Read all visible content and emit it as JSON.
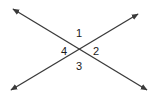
{
  "diagram": {
    "type": "intersecting-lines",
    "stroke_color": "#3a3a3a",
    "label_color": "#1a1a1a",
    "background": "#ffffff",
    "lines": [
      {
        "name": "line-a",
        "from": [
          13,
          9
        ],
        "to": [
          147,
          90
        ],
        "arrows": "both"
      },
      {
        "name": "line-b",
        "from": [
          11,
          90
        ],
        "to": [
          138,
          14
        ],
        "arrows": "both"
      }
    ],
    "intersection": [
      79,
      50
    ],
    "labels": [
      {
        "text": "1",
        "position": "top",
        "x": 79,
        "y": 37
      },
      {
        "text": "2",
        "position": "right",
        "x": 96,
        "y": 55
      },
      {
        "text": "3",
        "position": "bottom",
        "x": 79,
        "y": 70
      },
      {
        "text": "4",
        "position": "left",
        "x": 64,
        "y": 55
      }
    ]
  }
}
